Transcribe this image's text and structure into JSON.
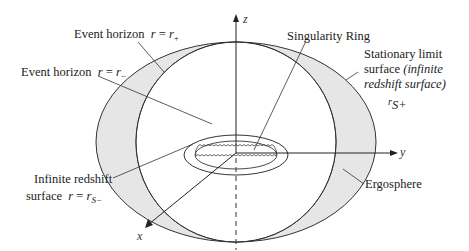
{
  "diagram": {
    "labels": {
      "event_horizon_plus": {
        "text": "Event horizon",
        "eq_lhs": "r",
        "eq": " = ",
        "eq_rhs": "r",
        "sub": "+"
      },
      "event_horizon_minus": {
        "text": "Event horizon",
        "eq_lhs": "r",
        "eq": " = ",
        "eq_rhs": "r",
        "sub": "−"
      },
      "singularity_ring": "Singularity Ring",
      "stationary_limit": {
        "line1": "Stationary limit",
        "line2_plain": "surface ",
        "line2_italic": "(infinite",
        "line3_italic": "redshift surface)",
        "symbol": "r",
        "symbol_sub": "S+"
      },
      "infinite_redshift": {
        "line1": "Infinite redshift",
        "line2_plain": "surface",
        "eq_lhs": "r",
        "eq": " = ",
        "eq_rhs": "r",
        "sub": "S−"
      },
      "ergosphere": "Ergosphere"
    },
    "axes": {
      "x": "x",
      "y": "y",
      "z": "z"
    },
    "colors": {
      "ergosphere_fill": "#e6e6e6",
      "stroke": "#333333",
      "background": "#ffffff"
    }
  }
}
